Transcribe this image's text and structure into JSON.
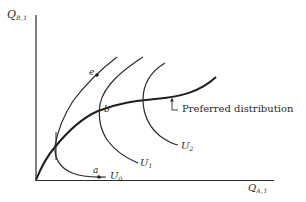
{
  "diagram": {
    "type": "economics-utility-possibility",
    "axes": {
      "y": {
        "label_main": "Q",
        "label_sub": "B,1"
      },
      "x": {
        "label_main": "Q",
        "label_sub": "A,1"
      }
    },
    "curves": [
      {
        "id": "preferred",
        "label": "Preferred distribution"
      },
      {
        "id": "U0",
        "label_main": "U",
        "label_sub": "0"
      },
      {
        "id": "U1",
        "label_main": "U",
        "label_sub": "1"
      },
      {
        "id": "U2",
        "label_main": "U",
        "label_sub": "2"
      }
    ],
    "points": [
      {
        "id": "a",
        "label": "a"
      },
      {
        "id": "b",
        "label": "b"
      },
      {
        "id": "e",
        "label": "e"
      }
    ],
    "colors": {
      "ink": "#2a2a2a",
      "background": "#ffffff"
    }
  }
}
